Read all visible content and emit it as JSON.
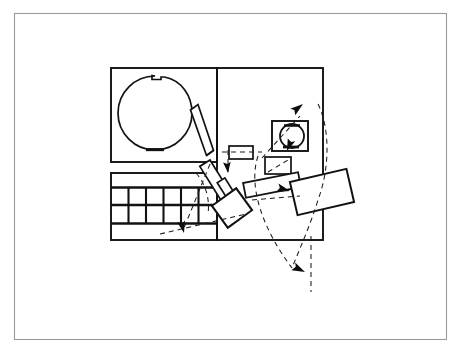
{
  "figure": {
    "kind": "technical-line-drawing",
    "title": "",
    "caption": "",
    "canvas": {
      "width": 460,
      "height": 353,
      "background": "#ffffff"
    },
    "outer_frame": {
      "name": "outer-frame",
      "x": 14,
      "y": 13,
      "width": 433,
      "height": 327,
      "stroke": "#9a9a9a",
      "stroke_width": 1.1
    },
    "style": {
      "line_color": "#121212",
      "dash_color": "#1c1c1c",
      "fill_color": "#ffffff",
      "thin_stroke": 1.3,
      "medium_stroke": 1.8,
      "thick_stroke": 2.4,
      "dash_pattern": "5 4"
    },
    "panels": [
      {
        "name": "panel-top-left",
        "label": "",
        "x": 111,
        "y": 68,
        "width": 106,
        "height": 94,
        "contents": "circle-with-notch-and-slanted-bar"
      },
      {
        "name": "panel-bottom-left",
        "label": "",
        "x": 111,
        "y": 173,
        "width": 106,
        "height": 67,
        "contents": "grid-table"
      },
      {
        "name": "panel-right",
        "label": "",
        "x": 217,
        "y": 68,
        "width": 106,
        "height": 172,
        "contents": "mechanical-assembly"
      }
    ],
    "grid_table": {
      "name": "grid-table",
      "x": 111,
      "y": 173,
      "width": 106,
      "height": 67,
      "top_blank_row_height": 14,
      "bottom_blank_row_height": 16,
      "cell_rows": 2,
      "cell_columns": 6,
      "row_values": [
        [
          "",
          "",
          "",
          "",
          "",
          ""
        ],
        [
          "",
          "",
          "",
          "",
          "",
          ""
        ]
      ]
    },
    "circle_part": {
      "name": "notched-disc",
      "center_x": 155,
      "center_y": 113,
      "radius": 37,
      "notch": {
        "x": 152,
        "y": 77,
        "width": 9,
        "height": 4
      }
    },
    "slanted_bar": {
      "name": "slanted-bar",
      "points": "193,113 200,107 214,152 207,157",
      "angle_deg": 17
    },
    "assembly_parts": [
      {
        "name": "circle-in-rectangle",
        "type": "rect-with-circle",
        "x": 272,
        "y": 121,
        "width": 36,
        "height": 30,
        "circle_center_x": 292,
        "circle_center_y": 136,
        "circle_radius": 12
      },
      {
        "name": "small-rectangle-left",
        "type": "rect",
        "x": 229,
        "y": 146,
        "width": 24,
        "height": 13
      },
      {
        "name": "small-rectangle-mid",
        "type": "rect",
        "x": 265,
        "y": 157,
        "width": 26,
        "height": 17
      },
      {
        "name": "rotated-thin-bar",
        "type": "rotated-rect",
        "cx": 272,
        "cy": 185,
        "width": 56,
        "height": 15,
        "angle_deg": -11
      },
      {
        "name": "rotated-large-block",
        "type": "rotated-rect",
        "cx": 322,
        "cy": 192,
        "width": 58,
        "height": 34,
        "angle_deg": -13
      },
      {
        "name": "clamp-body",
        "type": "rotated-rect",
        "cx": 232,
        "cy": 208,
        "width": 30,
        "height": 27,
        "angle_deg": -36
      },
      {
        "name": "clamp-prong-outer",
        "type": "rotated-rect",
        "cx": 216,
        "cy": 181,
        "width": 12,
        "height": 42,
        "angle_deg": -32
      },
      {
        "name": "clamp-prong-inner",
        "type": "rotated-rect",
        "cx": 228,
        "cy": 192,
        "width": 9,
        "height": 30,
        "angle_deg": -32
      }
    ],
    "motion_paths": [
      {
        "name": "dashed-arc-main",
        "description": "large dashed swing arc from upper right down to lower area",
        "path": "M 318,104 C 330,128 330,168 318,200 C 310,226 300,248 292,268"
      },
      {
        "name": "dashed-arc-lower-left",
        "description": "dashed arc from clamp region down to lower arrow",
        "path": "M 258,156 C 248,186 262,228 292,268"
      },
      {
        "name": "dashed-line-vertical-right",
        "description": "vertical dashed reference line on right",
        "path": "M 311,236 L 311,292"
      },
      {
        "name": "dashed-line-through-small-rect",
        "description": "horizontal dashed line through left small rectangle",
        "path": "M 222,152 L 262,152"
      },
      {
        "name": "dashed-line-grid-diagonal",
        "description": "diagonal dashed line into grid panel",
        "path": "M 210,164 L 184,228"
      },
      {
        "name": "dashed-line-grid-horizontal",
        "description": "dashed line crossing lower grid region",
        "path": "M 160,234 L 246,214"
      },
      {
        "name": "dashed-line-to-circle-rect",
        "description": "dashed line to circle-in-rectangle",
        "path": "M 262,158 L 300,116"
      },
      {
        "name": "dashed-line-mid-rect",
        "description": "dashed diagonal inside mid small rectangle",
        "path": "M 268,172 L 288,160"
      },
      {
        "name": "dashed-line-block-lower",
        "description": "dashed line under rotated blocks",
        "path": "M 252,200 L 300,196"
      }
    ],
    "arrowheads": [
      {
        "name": "arrow-up-right-top",
        "x": 300,
        "y": 106,
        "angle_deg": -42
      },
      {
        "name": "arrow-down-circle-rect",
        "x": 288,
        "y": 150,
        "angle_deg": 108
      },
      {
        "name": "arrow-into-block",
        "x": 286,
        "y": 190,
        "angle_deg": 12
      },
      {
        "name": "arrow-down-grid",
        "x": 183,
        "y": 232,
        "angle_deg": 74
      },
      {
        "name": "arrow-lower-right",
        "x": 302,
        "y": 272,
        "angle_deg": 28
      },
      {
        "name": "arrow-down-prong",
        "x": 228,
        "y": 171,
        "angle_deg": 80
      }
    ]
  }
}
